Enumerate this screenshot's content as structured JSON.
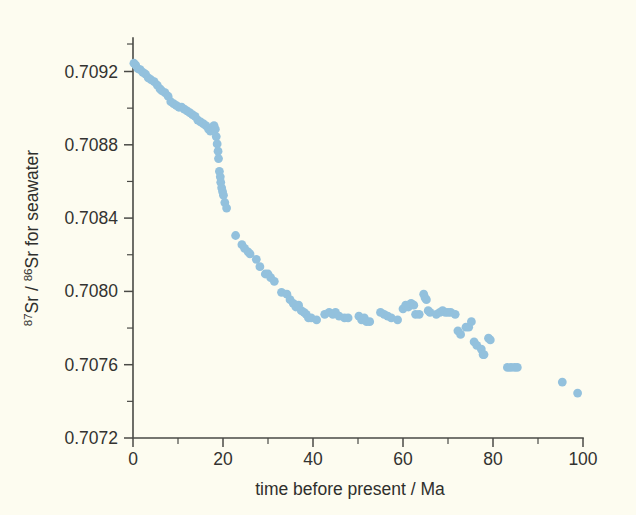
{
  "figure": {
    "background_color": "#fdfcf0",
    "point_color": "#93c1dd",
    "axis_color": "#4a4a46",
    "text_color": "#333330"
  },
  "chart_data": {
    "type": "scatter",
    "title": "",
    "subtitle": "",
    "xlabel": "time before present / Ma",
    "ylabel_parts": {
      "sup1": "87",
      "mid1": "Sr / ",
      "sup2": "86",
      "mid2": "Sr for seawater"
    },
    "ylabel": "87Sr / 86Sr for seawater",
    "xlim": [
      0,
      100
    ],
    "ylim": [
      0.7072,
      0.70935
    ],
    "xticks": [
      0,
      20,
      40,
      60,
      80,
      100
    ],
    "xtick_labels": [
      "0",
      "20",
      "40",
      "60",
      "80",
      "100"
    ],
    "xminor_ticks": [
      10,
      30,
      50,
      70,
      90
    ],
    "yticks": [
      0.7072,
      0.7076,
      0.708,
      0.7084,
      0.7088,
      0.7092
    ],
    "ytick_labels": [
      "0.7072",
      "0.7076",
      "0.7080",
      "0.7084",
      "0.7088",
      "0.7092"
    ],
    "yminor_ticks": [
      0.7074,
      0.7078,
      0.7082,
      0.7086,
      0.709,
      0.70935
    ],
    "grid": false,
    "legend": "none",
    "marker_radius_px": 4.4,
    "points": [
      [
        0.2,
        0.709245
      ],
      [
        0.6,
        0.709235
      ],
      [
        1.1,
        0.709215
      ],
      [
        1.6,
        0.70921
      ],
      [
        2.2,
        0.709195
      ],
      [
        2.8,
        0.709185
      ],
      [
        3.4,
        0.709165
      ],
      [
        4.0,
        0.709155
      ],
      [
        4.7,
        0.709145
      ],
      [
        5.4,
        0.709125
      ],
      [
        6.0,
        0.709105
      ],
      [
        6.4,
        0.709095
      ],
      [
        7.1,
        0.709085
      ],
      [
        7.8,
        0.709065
      ],
      [
        8.4,
        0.709035
      ],
      [
        9.0,
        0.709025
      ],
      [
        9.6,
        0.709015
      ],
      [
        10.2,
        0.709005
      ],
      [
        10.8,
        0.709005
      ],
      [
        11.4,
        0.708995
      ],
      [
        12.0,
        0.708985
      ],
      [
        12.6,
        0.708975
      ],
      [
        13.2,
        0.708965
      ],
      [
        13.8,
        0.708955
      ],
      [
        14.4,
        0.708935
      ],
      [
        15.0,
        0.708925
      ],
      [
        15.6,
        0.708915
      ],
      [
        16.2,
        0.708905
      ],
      [
        16.8,
        0.708885
      ],
      [
        17.2,
        0.708875
      ],
      [
        17.6,
        0.708895
      ],
      [
        18.0,
        0.708905
      ],
      [
        18.3,
        0.708885
      ],
      [
        18.5,
        0.708845
      ],
      [
        18.7,
        0.708805
      ],
      [
        18.9,
        0.708765
      ],
      [
        19.0,
        0.708725
      ],
      [
        19.2,
        0.708655
      ],
      [
        19.4,
        0.708625
      ],
      [
        19.5,
        0.708595
      ],
      [
        19.7,
        0.708565
      ],
      [
        19.9,
        0.708545
      ],
      [
        20.1,
        0.708525
      ],
      [
        20.4,
        0.708485
      ],
      [
        20.8,
        0.708455
      ],
      [
        22.8,
        0.708305
      ],
      [
        24.2,
        0.708255
      ],
      [
        24.8,
        0.708235
      ],
      [
        25.6,
        0.708215
      ],
      [
        26.0,
        0.708205
      ],
      [
        27.4,
        0.708175
      ],
      [
        28.2,
        0.708135
      ],
      [
        29.4,
        0.708095
      ],
      [
        30.0,
        0.708095
      ],
      [
        30.6,
        0.708075
      ],
      [
        31.4,
        0.708055
      ],
      [
        33.0,
        0.707995
      ],
      [
        34.2,
        0.707985
      ],
      [
        34.9,
        0.707955
      ],
      [
        35.6,
        0.707935
      ],
      [
        36.2,
        0.707915
      ],
      [
        36.8,
        0.707925
      ],
      [
        37.4,
        0.707895
      ],
      [
        38.0,
        0.707885
      ],
      [
        38.5,
        0.707875
      ],
      [
        39.0,
        0.707855
      ],
      [
        39.6,
        0.707855
      ],
      [
        40.8,
        0.707845
      ],
      [
        42.6,
        0.707875
      ],
      [
        43.6,
        0.707885
      ],
      [
        44.4,
        0.707875
      ],
      [
        45.0,
        0.707885
      ],
      [
        45.8,
        0.707865
      ],
      [
        47.0,
        0.707855
      ],
      [
        47.8,
        0.707855
      ],
      [
        50.2,
        0.707865
      ],
      [
        50.8,
        0.707845
      ],
      [
        51.4,
        0.707855
      ],
      [
        51.9,
        0.707835
      ],
      [
        52.6,
        0.707835
      ],
      [
        55.0,
        0.707885
      ],
      [
        55.8,
        0.707875
      ],
      [
        56.6,
        0.707865
      ],
      [
        57.4,
        0.707855
      ],
      [
        58.8,
        0.707845
      ],
      [
        60.0,
        0.707905
      ],
      [
        60.6,
        0.707925
      ],
      [
        61.2,
        0.707915
      ],
      [
        61.8,
        0.707935
      ],
      [
        62.4,
        0.707925
      ],
      [
        62.8,
        0.707875
      ],
      [
        63.6,
        0.707875
      ],
      [
        64.6,
        0.707985
      ],
      [
        64.9,
        0.707965
      ],
      [
        65.2,
        0.707955
      ],
      [
        65.6,
        0.707895
      ],
      [
        66.0,
        0.707885
      ],
      [
        67.4,
        0.707875
      ],
      [
        68.2,
        0.707885
      ],
      [
        68.8,
        0.707895
      ],
      [
        69.4,
        0.707885
      ],
      [
        70.0,
        0.707885
      ],
      [
        70.6,
        0.707885
      ],
      [
        71.6,
        0.707875
      ],
      [
        72.2,
        0.707785
      ],
      [
        72.8,
        0.707765
      ],
      [
        74.0,
        0.707805
      ],
      [
        74.6,
        0.707805
      ],
      [
        75.2,
        0.707835
      ],
      [
        75.8,
        0.707725
      ],
      [
        76.4,
        0.707705
      ],
      [
        77.4,
        0.707685
      ],
      [
        77.8,
        0.707655
      ],
      [
        78.0,
        0.707655
      ],
      [
        79.0,
        0.707745
      ],
      [
        79.4,
        0.707735
      ],
      [
        83.2,
        0.707585
      ],
      [
        84.0,
        0.707585
      ],
      [
        84.8,
        0.707585
      ],
      [
        85.4,
        0.707585
      ],
      [
        95.4,
        0.707505
      ],
      [
        98.8,
        0.707445
      ]
    ]
  },
  "caption_fragment": ""
}
